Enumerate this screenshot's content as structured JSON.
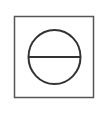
{
  "symbol": {
    "name": "circle-with-horizontal-line-in-square",
    "icon": "theta-circle-icon",
    "stroke_color": "#333333",
    "background": "#ffffff"
  }
}
